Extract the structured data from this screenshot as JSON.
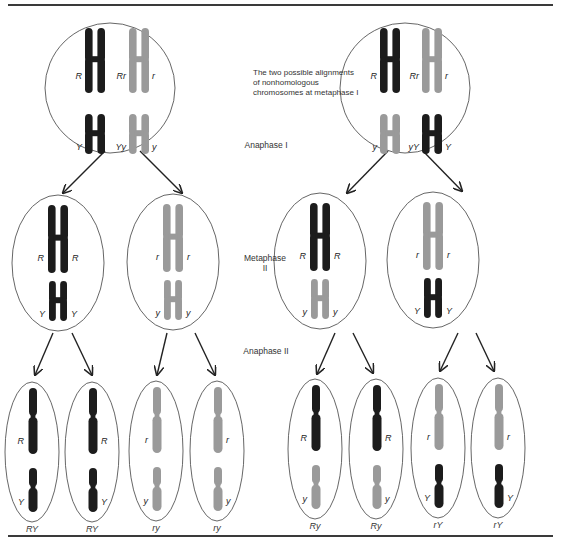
{
  "colors": {
    "dark_chromosome": "#1c1c1c",
    "light_chromosome": "#9a9a9a",
    "outline": "#555555",
    "arrow": "#222222",
    "rule": "#3a3a3a"
  },
  "captions": {
    "alignment_note_line1": "The two possible alignments",
    "alignment_note_line2": "of nonhomologous",
    "alignment_note_line3": "chromosomes at metaphase I",
    "anaphase_1": "Anaphase I",
    "metaphase_2_line1": "Metaphase",
    "metaphase_2_line2": "II",
    "anaphase_2": "Anaphase II"
  },
  "metaphase_1": [
    {
      "id": "alignment-left",
      "cx": 110,
      "cy": 88,
      "r": 65,
      "chromosomes": [
        {
          "shade": "dark",
          "kind": "large",
          "x": 95,
          "y": 38,
          "left_label": "R",
          "right_label": ""
        },
        {
          "shade": "light",
          "kind": "large",
          "x": 139,
          "y": 38,
          "left_label": "Rr",
          "right_label": "r"
        },
        {
          "shade": "dark",
          "kind": "small",
          "x": 95,
          "y": 112,
          "left_label": "Y",
          "right_label": ""
        },
        {
          "shade": "light",
          "kind": "small",
          "x": 139,
          "y": 112,
          "left_label": "Yy",
          "right_label": "y"
        }
      ]
    },
    {
      "id": "alignment-right",
      "cx": 405,
      "cy": 88,
      "r": 65,
      "chromosomes": [
        {
          "shade": "dark",
          "kind": "large",
          "x": 390,
          "y": 38,
          "left_label": "R",
          "right_label": ""
        },
        {
          "shade": "light",
          "kind": "large",
          "x": 432,
          "y": 38,
          "left_label": "Rr",
          "right_label": "r"
        },
        {
          "shade": "light",
          "kind": "small",
          "x": 390,
          "y": 112,
          "left_label": "y",
          "right_label": ""
        },
        {
          "shade": "dark",
          "kind": "small",
          "x": 432,
          "y": 112,
          "left_label": "yY",
          "right_label": "Y"
        }
      ]
    }
  ],
  "metaphase_2": [
    {
      "cx": 58,
      "cy": 263,
      "rx": 46,
      "ry": 68,
      "top": {
        "shade": "dark",
        "label": "R"
      },
      "bottom": {
        "shade": "dark",
        "label": "Y"
      }
    },
    {
      "cx": 173,
      "cy": 262,
      "rx": 46,
      "ry": 68,
      "top": {
        "shade": "light",
        "label": "r"
      },
      "bottom": {
        "shade": "light",
        "label": "y"
      }
    },
    {
      "cx": 320,
      "cy": 261,
      "rx": 46,
      "ry": 68,
      "top": {
        "shade": "dark",
        "label": "R"
      },
      "bottom": {
        "shade": "light",
        "label": "y"
      }
    },
    {
      "cx": 433,
      "cy": 260,
      "rx": 46,
      "ry": 68,
      "top": {
        "shade": "light",
        "label": "r"
      },
      "bottom": {
        "shade": "dark",
        "label": "Y"
      }
    }
  ],
  "gametes": [
    {
      "cx": 32,
      "cy": 452,
      "top_shade": "dark",
      "bottom_shade": "dark",
      "r_label": "R",
      "y_label": "Y",
      "label_side": "left",
      "genotype": "RY"
    },
    {
      "cx": 92,
      "cy": 452,
      "top_shade": "dark",
      "bottom_shade": "dark",
      "r_label": "R",
      "y_label": "Y",
      "label_side": "right",
      "genotype": "RY"
    },
    {
      "cx": 156,
      "cy": 451,
      "top_shade": "light",
      "bottom_shade": "light",
      "r_label": "r",
      "y_label": "y",
      "label_side": "left",
      "genotype": "ry"
    },
    {
      "cx": 217,
      "cy": 451,
      "top_shade": "light",
      "bottom_shade": "light",
      "r_label": "r",
      "y_label": "y",
      "label_side": "right",
      "genotype": "ry"
    },
    {
      "cx": 315,
      "cy": 449,
      "top_shade": "dark",
      "bottom_shade": "light",
      "r_label": "R",
      "y_label": "y",
      "label_side": "left",
      "genotype": "Ry"
    },
    {
      "cx": 376,
      "cy": 449,
      "top_shade": "dark",
      "bottom_shade": "light",
      "r_label": "R",
      "y_label": "y",
      "label_side": "right",
      "genotype": "Ry"
    },
    {
      "cx": 438,
      "cy": 448,
      "top_shade": "light",
      "bottom_shade": "dark",
      "r_label": "r",
      "y_label": "Y",
      "label_side": "left",
      "genotype": "rY"
    },
    {
      "cx": 498,
      "cy": 448,
      "top_shade": "light",
      "bottom_shade": "dark",
      "r_label": "r",
      "y_label": "Y",
      "label_side": "right",
      "genotype": "rY"
    }
  ],
  "arrows": [
    {
      "x1": 105,
      "y1": 151,
      "x2": 63,
      "y2": 193
    },
    {
      "x1": 140,
      "y1": 151,
      "x2": 182,
      "y2": 193
    },
    {
      "x1": 388,
      "y1": 151,
      "x2": 347,
      "y2": 193
    },
    {
      "x1": 423,
      "y1": 151,
      "x2": 462,
      "y2": 191
    },
    {
      "x1": 53,
      "y1": 333,
      "x2": 35,
      "y2": 375
    },
    {
      "x1": 72,
      "y1": 333,
      "x2": 92,
      "y2": 375
    },
    {
      "x1": 167,
      "y1": 333,
      "x2": 157,
      "y2": 375
    },
    {
      "x1": 195,
      "y1": 333,
      "x2": 215,
      "y2": 375
    },
    {
      "x1": 335,
      "y1": 333,
      "x2": 317,
      "y2": 374
    },
    {
      "x1": 353,
      "y1": 333,
      "x2": 373,
      "y2": 373
    },
    {
      "x1": 458,
      "y1": 333,
      "x2": 440,
      "y2": 371
    },
    {
      "x1": 476,
      "y1": 333,
      "x2": 494,
      "y2": 371
    }
  ]
}
